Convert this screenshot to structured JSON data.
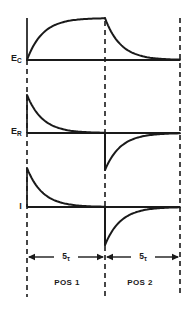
{
  "colors": {
    "ink": "#1a1a1a",
    "background": "#ffffff"
  },
  "panels": [
    {
      "id": "ec",
      "label": {
        "main": "E",
        "sub": "C"
      },
      "pos1_shape": "exponential-rise",
      "pos2_shape": "exponential-decay"
    },
    {
      "id": "er",
      "label": {
        "main": "E",
        "sub": "R"
      },
      "pos1_shape": "exponential-decay",
      "pos2_shape": "negative-spike-exponential-return"
    },
    {
      "id": "i",
      "label": {
        "main": "I",
        "sub": ""
      },
      "pos1_shape": "exponential-decay",
      "pos2_shape": "negative-spike-exponential-return"
    }
  ],
  "timeline": {
    "intervals": [
      {
        "duration_main": "5",
        "duration_sub": "τ",
        "region_label": "POS 1"
      },
      {
        "duration_main": "5",
        "duration_sub": "τ",
        "region_label": "POS 2"
      }
    ]
  }
}
